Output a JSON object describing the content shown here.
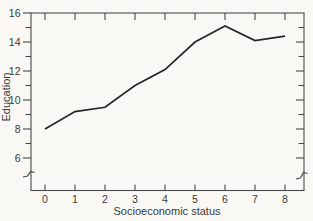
{
  "figure": {
    "background": "#f9f8f5",
    "axis_color": "#4a4a4a",
    "line_color": "#262626",
    "text_color": "#3b3b3b"
  },
  "chart_data": {
    "type": "line",
    "title": "",
    "xlabel": "Socioeconomic status",
    "ylabel": "Education",
    "x": [
      0,
      1,
      2,
      3,
      4,
      5,
      6,
      7,
      8
    ],
    "values": [
      8.0,
      9.2,
      9.5,
      11.0,
      12.1,
      14.0,
      15.1,
      14.1,
      14.4
    ],
    "series_name": "Mean education by socioeconomic status",
    "xlim": [
      0,
      8
    ],
    "ylim": [
      6,
      16
    ],
    "x_tick_labels": [
      "0",
      "1",
      "2",
      "3",
      "4",
      "5",
      "6",
      "7",
      "8"
    ],
    "x_ticks": [
      0,
      1,
      2,
      3,
      4,
      5,
      6,
      7,
      8
    ],
    "y_major_ticks": [
      6,
      8,
      10,
      12,
      14,
      16
    ],
    "y_major_labels": [
      "6",
      "8",
      "10",
      "12",
      "14",
      "16"
    ],
    "y_minor_ticks": [
      7,
      9,
      11,
      13,
      15
    ],
    "y_axis_break": true,
    "grid": false,
    "legend": "none",
    "frame": "box with ticks on all four sides"
  }
}
